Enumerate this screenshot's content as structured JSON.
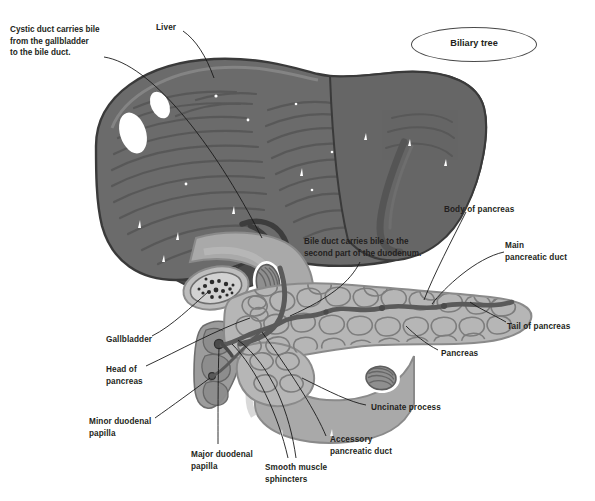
{
  "figure": {
    "title": "Biliary tree",
    "palette": {
      "liver_fill": "#6b6b6b",
      "liver_dark": "#4d4d4d",
      "liver_outline": "#3a3a3a",
      "pancreas_fill": "#b6b6b6",
      "pancreas_lobule_outline": "#7d7d7d",
      "duodenum_fill": "#a9a9a9",
      "duct_color": "#5a5a5a",
      "leader_line": "#1a1a1a",
      "text_color": "#231f20",
      "background": "#ffffff"
    }
  },
  "callouts": [
    {
      "id": "cystic-duct-callout",
      "text": "Cystic duct carries bile\nfrom the gallbladder\nto the bile duct.",
      "x": 10,
      "y": 24
    },
    {
      "id": "bile-duct-callout",
      "text": "Bile duct carries bile to the\nsecond part of the duodenum.",
      "x": 304,
      "y": 236
    }
  ],
  "labels": [
    {
      "id": "liver",
      "text": "Liver",
      "x": 156,
      "y": 22,
      "align": "left"
    },
    {
      "id": "body-of-pancreas",
      "text": "Body of pancreas",
      "x": 444,
      "y": 204,
      "align": "left"
    },
    {
      "id": "main-pancreatic-duct",
      "text": "Main\npancreatic duct",
      "x": 505,
      "y": 240,
      "align": "left"
    },
    {
      "id": "tail-of-pancreas",
      "text": "Tail of pancreas",
      "x": 507,
      "y": 321,
      "align": "left"
    },
    {
      "id": "pancreas",
      "text": "Pancreas",
      "x": 441,
      "y": 348,
      "align": "left"
    },
    {
      "id": "gallbladder",
      "text": "Gallbladder",
      "x": 106,
      "y": 334,
      "align": "left"
    },
    {
      "id": "head-of-pancreas",
      "text": "Head of\npancreas",
      "x": 106,
      "y": 364,
      "align": "left"
    },
    {
      "id": "minor-duodenal-papilla",
      "text": "Minor duodenal\npapilla",
      "x": 89,
      "y": 416,
      "align": "left"
    },
    {
      "id": "major-duodenal-papilla",
      "text": "Major duodenal\npapilla",
      "x": 191,
      "y": 449,
      "align": "left"
    },
    {
      "id": "smooth-muscle-sphincters",
      "text": "Smooth muscle\nsphincters",
      "x": 265,
      "y": 462,
      "align": "left"
    },
    {
      "id": "accessory-pancreatic-duct",
      "text": "Accessory\npancreatic duct",
      "x": 330,
      "y": 434,
      "align": "left"
    },
    {
      "id": "uncinate-process",
      "text": "Uncinate process",
      "x": 371,
      "y": 402,
      "align": "left"
    }
  ],
  "structures": [
    {
      "id": "liver",
      "name": "Liver"
    },
    {
      "id": "gallbladder",
      "name": "Gallbladder"
    },
    {
      "id": "cystic-duct",
      "name": "Cystic duct"
    },
    {
      "id": "bile-duct",
      "name": "Bile duct"
    },
    {
      "id": "pancreas",
      "name": "Pancreas"
    },
    {
      "id": "main-pancreatic-duct",
      "name": "Main pancreatic duct"
    },
    {
      "id": "accessory-pancreatic-duct",
      "name": "Accessory pancreatic duct"
    },
    {
      "id": "duodenum",
      "name": "Duodenum"
    },
    {
      "id": "major-duodenal-papilla",
      "name": "Major duodenal papilla"
    },
    {
      "id": "minor-duodenal-papilla",
      "name": "Minor duodenal papilla"
    },
    {
      "id": "uncinate-process",
      "name": "Uncinate process"
    }
  ]
}
